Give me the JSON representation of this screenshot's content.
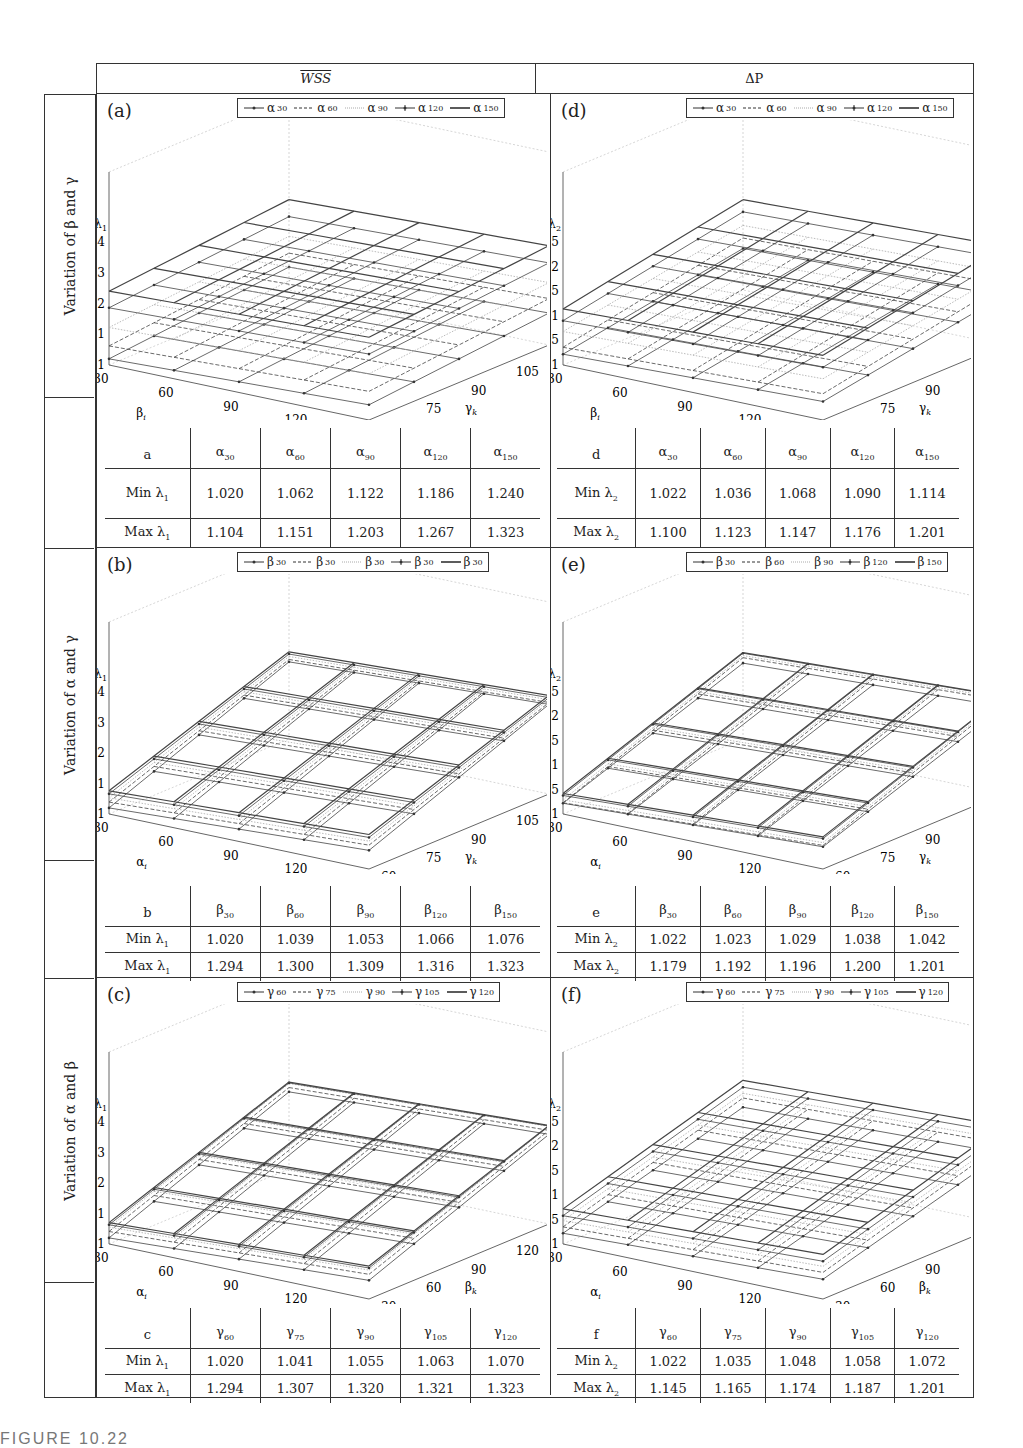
{
  "column_headers": {
    "wss": "WSS",
    "dp": "ΔP"
  },
  "row_headers": [
    "Variation of β and γ",
    "Variation of α and γ",
    "Variation of α and β"
  ],
  "caption_clipped": "FIGURE 10.22",
  "chart_data": [
    {
      "id": "a",
      "type": "surface3d",
      "title": "(a)",
      "zlabel": "λ1",
      "zlabel_main": "λ",
      "zlabel_sub": "1",
      "zticks": [
        "1",
        "1.1",
        "1.2",
        "1.3",
        "1.4"
      ],
      "zlim": [
        1.0,
        1.4
      ],
      "xlabel_main": "β",
      "xlabel_sub": "i",
      "xticks": [
        "30",
        "60",
        "90",
        "120",
        "150"
      ],
      "ylabel_main": "γ",
      "ylabel_sub": "k",
      "yticks": [
        "60",
        "75",
        "90",
        "105",
        "120"
      ],
      "legend": [
        {
          "main": "α",
          "sub": "30",
          "style": "dot"
        },
        {
          "main": "α",
          "sub": "60",
          "style": "dash"
        },
        {
          "main": "α",
          "sub": "90",
          "style": "light"
        },
        {
          "main": "α",
          "sub": "120",
          "style": "plus"
        },
        {
          "main": "α",
          "sub": "150",
          "style": "solid"
        }
      ],
      "series_min": [
        1.02,
        1.062,
        1.122,
        1.186,
        1.24
      ],
      "series_max": [
        1.104,
        1.151,
        1.203,
        1.267,
        1.323
      ],
      "table": {
        "corner": "a",
        "headers": [
          {
            "main": "α",
            "sub": "30"
          },
          {
            "main": "α",
            "sub": "60"
          },
          {
            "main": "α",
            "sub": "90"
          },
          {
            "main": "α",
            "sub": "120"
          },
          {
            "main": "α",
            "sub": "150"
          }
        ],
        "rows": [
          {
            "label_main": "Min λ",
            "label_sub": "1",
            "values": [
              "1.020",
              "1.062",
              "1.122",
              "1.186",
              "1.240"
            ]
          },
          {
            "label_main": "Max λ",
            "label_sub": "1",
            "values": [
              "1.104",
              "1.151",
              "1.203",
              "1.267",
              "1.323"
            ]
          }
        ]
      }
    },
    {
      "id": "d",
      "type": "surface3d",
      "title": "(d)",
      "zlabel": "λ2",
      "zlabel_main": "λ",
      "zlabel_sub": "2",
      "zticks": [
        "1",
        "1.05",
        "1.1",
        "1.15",
        "1.2",
        "1.25"
      ],
      "zlim": [
        1.0,
        1.25
      ],
      "xlabel_main": "β",
      "xlabel_sub": "i",
      "xticks": [
        "30",
        "60",
        "90",
        "120",
        "150"
      ],
      "ylabel_main": "γ",
      "ylabel_sub": "k",
      "yticks": [
        "60",
        "75",
        "90",
        "105",
        "120"
      ],
      "legend": [
        {
          "main": "α",
          "sub": "30",
          "style": "dot"
        },
        {
          "main": "α",
          "sub": "60",
          "style": "dash"
        },
        {
          "main": "α",
          "sub": "90",
          "style": "light"
        },
        {
          "main": "α",
          "sub": "120",
          "style": "plus"
        },
        {
          "main": "α",
          "sub": "150",
          "style": "solid"
        }
      ],
      "series_min": [
        1.022,
        1.036,
        1.068,
        1.09,
        1.114
      ],
      "series_max": [
        1.1,
        1.123,
        1.147,
        1.176,
        1.201
      ],
      "table": {
        "corner": "d",
        "headers": [
          {
            "main": "α",
            "sub": "30"
          },
          {
            "main": "α",
            "sub": "60"
          },
          {
            "main": "α",
            "sub": "90"
          },
          {
            "main": "α",
            "sub": "120"
          },
          {
            "main": "α",
            "sub": "150"
          }
        ],
        "rows": [
          {
            "label_main": "Min λ",
            "label_sub": "2",
            "values": [
              "1.022",
              "1.036",
              "1.068",
              "1.090",
              "1.114"
            ]
          },
          {
            "label_main": "Max λ",
            "label_sub": "2",
            "values": [
              "1.100",
              "1.123",
              "1.147",
              "1.176",
              "1.201"
            ]
          }
        ]
      }
    },
    {
      "id": "b",
      "type": "surface3d",
      "title": "(b)",
      "zlabel": "λ1",
      "zlabel_main": "λ",
      "zlabel_sub": "1",
      "zticks": [
        "1",
        "1.1",
        "1.2",
        "1.3",
        "1.4"
      ],
      "zlim": [
        1.0,
        1.4
      ],
      "xlabel_main": "α",
      "xlabel_sub": "i",
      "xticks": [
        "30",
        "60",
        "90",
        "120",
        "150"
      ],
      "ylabel_main": "γ",
      "ylabel_sub": "k",
      "yticks": [
        "60",
        "75",
        "90",
        "105",
        "120"
      ],
      "legend": [
        {
          "main": "β",
          "sub": "30",
          "style": "dot"
        },
        {
          "main": "β",
          "sub": "30",
          "style": "dash"
        },
        {
          "main": "β",
          "sub": "30",
          "style": "light"
        },
        {
          "main": "β",
          "sub": "30",
          "style": "plus"
        },
        {
          "main": "β",
          "sub": "30",
          "style": "solid"
        }
      ],
      "series_min": [
        1.02,
        1.039,
        1.053,
        1.066,
        1.076
      ],
      "series_max": [
        1.294,
        1.3,
        1.309,
        1.316,
        1.323
      ],
      "table": {
        "corner": "b",
        "headers": [
          {
            "main": "β",
            "sub": "30"
          },
          {
            "main": "β",
            "sub": "60"
          },
          {
            "main": "β",
            "sub": "90"
          },
          {
            "main": "β",
            "sub": "120"
          },
          {
            "main": "β",
            "sub": "150"
          }
        ],
        "rows": [
          {
            "label_main": "Min λ",
            "label_sub": "1",
            "values": [
              "1.020",
              "1.039",
              "1.053",
              "1.066",
              "1.076"
            ]
          },
          {
            "label_main": "Max λ",
            "label_sub": "1",
            "values": [
              "1.294",
              "1.300",
              "1.309",
              "1.316",
              "1.323"
            ]
          }
        ]
      }
    },
    {
      "id": "e",
      "type": "surface3d",
      "title": "(e)",
      "zlabel": "λ2",
      "zlabel_main": "λ",
      "zlabel_sub": "2",
      "zticks": [
        "1",
        "1.05",
        "1.1",
        "1.15",
        "1.2",
        "1.25"
      ],
      "zlim": [
        1.0,
        1.25
      ],
      "xlabel_main": "α",
      "xlabel_sub": "i",
      "xticks": [
        "30",
        "60",
        "90",
        "120",
        "150"
      ],
      "ylabel_main": "γ",
      "ylabel_sub": "k",
      "yticks": [
        "60",
        "75",
        "90",
        "105",
        "120"
      ],
      "legend": [
        {
          "main": "β",
          "sub": "30",
          "style": "dot"
        },
        {
          "main": "β",
          "sub": "60",
          "style": "dash"
        },
        {
          "main": "β",
          "sub": "90",
          "style": "light"
        },
        {
          "main": "β",
          "sub": "120",
          "style": "plus"
        },
        {
          "main": "β",
          "sub": "150",
          "style": "solid"
        }
      ],
      "series_min": [
        1.022,
        1.023,
        1.029,
        1.038,
        1.042
      ],
      "series_max": [
        1.179,
        1.192,
        1.196,
        1.2,
        1.201
      ],
      "table": {
        "corner": "e",
        "headers": [
          {
            "main": "β",
            "sub": "30"
          },
          {
            "main": "β",
            "sub": "60"
          },
          {
            "main": "β",
            "sub": "90"
          },
          {
            "main": "β",
            "sub": "120"
          },
          {
            "main": "β",
            "sub": "150"
          }
        ],
        "rows": [
          {
            "label_main": "Min λ",
            "label_sub": "2",
            "values": [
              "1.022",
              "1.023",
              "1.029",
              "1.038",
              "1.042"
            ]
          },
          {
            "label_main": "Max λ",
            "label_sub": "2",
            "values": [
              "1.179",
              "1.192",
              "1.196",
              "1.200",
              "1.201"
            ]
          }
        ]
      }
    },
    {
      "id": "c",
      "type": "surface3d",
      "title": "(c)",
      "zlabel": "λ1",
      "zlabel_main": "λ",
      "zlabel_sub": "1",
      "zticks": [
        "1",
        "1.1",
        "1.2",
        "1.3",
        "1.4"
      ],
      "zlim": [
        1.0,
        1.4
      ],
      "xlabel_main": "α",
      "xlabel_sub": "i",
      "xticks": [
        "30",
        "60",
        "90",
        "120",
        "150"
      ],
      "ylabel_main": "β",
      "ylabel_sub": "k",
      "yticks": [
        "30",
        "60",
        "90",
        "120",
        "150"
      ],
      "legend": [
        {
          "main": "γ",
          "sub": "60",
          "style": "dot"
        },
        {
          "main": "γ",
          "sub": "75",
          "style": "dash"
        },
        {
          "main": "γ",
          "sub": "90",
          "style": "light"
        },
        {
          "main": "γ",
          "sub": "105",
          "style": "plus"
        },
        {
          "main": "γ",
          "sub": "120",
          "style": "solid"
        }
      ],
      "series_min": [
        1.02,
        1.041,
        1.055,
        1.063,
        1.07
      ],
      "series_max": [
        1.294,
        1.307,
        1.32,
        1.321,
        1.323
      ],
      "table": {
        "corner": "c",
        "headers": [
          {
            "main": "γ",
            "sub": "60"
          },
          {
            "main": "γ",
            "sub": "75"
          },
          {
            "main": "γ",
            "sub": "90"
          },
          {
            "main": "γ",
            "sub": "105"
          },
          {
            "main": "γ",
            "sub": "120"
          }
        ],
        "rows": [
          {
            "label_main": "Min λ",
            "label_sub": "1",
            "values": [
              "1.020",
              "1.041",
              "1.055",
              "1.063",
              "1.070"
            ]
          },
          {
            "label_main": "Max λ",
            "label_sub": "1",
            "values": [
              "1.294",
              "1.307",
              "1.320",
              "1.321",
              "1.323"
            ]
          }
        ]
      }
    },
    {
      "id": "f",
      "type": "surface3d",
      "title": "(f)",
      "zlabel": "λ2",
      "zlabel_main": "λ",
      "zlabel_sub": "2",
      "zticks": [
        "1",
        "1.05",
        "1.1",
        "1.15",
        "1.2",
        "1.25"
      ],
      "zlim": [
        1.0,
        1.25
      ],
      "xlabel_main": "α",
      "xlabel_sub": "i",
      "xticks": [
        "30",
        "60",
        "90",
        "120",
        "150"
      ],
      "ylabel_main": "β",
      "ylabel_sub": "k",
      "yticks": [
        "30",
        "60",
        "90",
        "120",
        "150"
      ],
      "legend": [
        {
          "main": "γ",
          "sub": "60",
          "style": "dot"
        },
        {
          "main": "γ",
          "sub": "75",
          "style": "dash"
        },
        {
          "main": "γ",
          "sub": "90",
          "style": "light"
        },
        {
          "main": "γ",
          "sub": "105",
          "style": "plus"
        },
        {
          "main": "γ",
          "sub": "120",
          "style": "solid"
        }
      ],
      "series_min": [
        1.022,
        1.035,
        1.048,
        1.058,
        1.072
      ],
      "series_max": [
        1.145,
        1.165,
        1.174,
        1.187,
        1.201
      ],
      "table": {
        "corner": "f",
        "headers": [
          {
            "main": "γ",
            "sub": "60"
          },
          {
            "main": "γ",
            "sub": "75"
          },
          {
            "main": "γ",
            "sub": "90"
          },
          {
            "main": "γ",
            "sub": "105"
          },
          {
            "main": "γ",
            "sub": "120"
          }
        ],
        "rows": [
          {
            "label_main": "Min λ",
            "label_sub": "2",
            "values": [
              "1.022",
              "1.035",
              "1.048",
              "1.058",
              "1.072"
            ]
          },
          {
            "label_main": "Max λ",
            "label_sub": "2",
            "values": [
              "1.145",
              "1.165",
              "1.174",
              "1.187",
              "1.201"
            ]
          }
        ]
      }
    }
  ]
}
